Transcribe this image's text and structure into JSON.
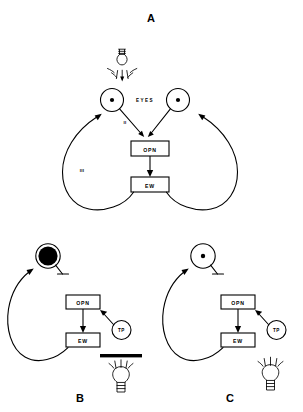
{
  "figure": {
    "title_a": "A",
    "title_b": "B",
    "title_c": "C"
  },
  "panel_a": {
    "label": "A",
    "eyes_label": "EYES",
    "opn_box": "OPN",
    "ew_box": "EW",
    "pathway_label_afferent": "II",
    "pathway_label_efferent": "III",
    "stimulus": "light-bulb",
    "left_pupil_state": "constricted",
    "right_pupil_state": "constricted"
  },
  "panel_b": {
    "label": "B",
    "opn_box": "OPN",
    "ew_box": "EW",
    "tp_node": "TP",
    "pupil_state": "dilated",
    "stimulus": "light-bulb",
    "light_blocked": "true",
    "occluder": "black-bar"
  },
  "panel_c": {
    "label": "C",
    "opn_box": "OPN",
    "ew_box": "EW",
    "tp_node": "TP",
    "pupil_state": "constricted",
    "stimulus": "light-bulb",
    "light_blocked": "false"
  },
  "colors": {
    "ink": "#000000",
    "background": "#ffffff"
  }
}
